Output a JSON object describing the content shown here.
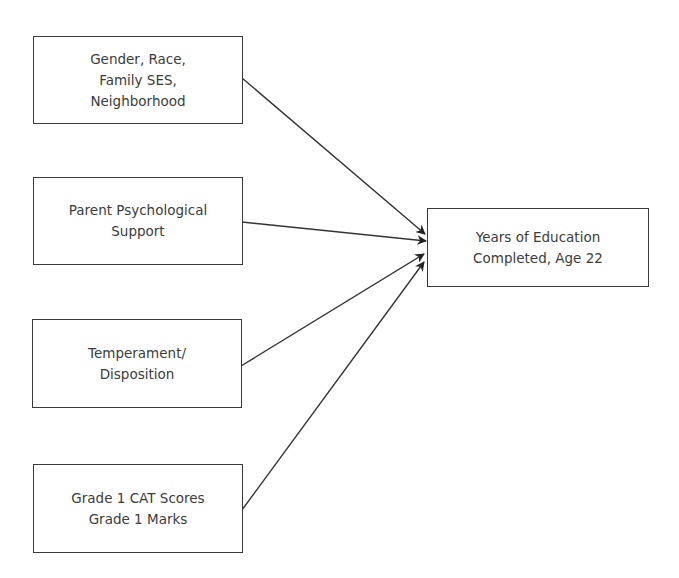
{
  "diagram": {
    "type": "path-diagram",
    "nodes": [
      {
        "id": "n1",
        "label": "Gender, Race,\nFamily SES,\nNeighborhood"
      },
      {
        "id": "n2",
        "label": "Parent Psychological\nSupport"
      },
      {
        "id": "n3",
        "label": "Temperament/\nDisposition"
      },
      {
        "id": "n4",
        "label": "Grade 1 CAT Scores\nGrade 1 Marks"
      },
      {
        "id": "outcome",
        "label": "Years of Education\nCompleted, Age 22"
      }
    ],
    "edges": [
      {
        "from": "n1",
        "to": "outcome"
      },
      {
        "from": "n2",
        "to": "outcome"
      },
      {
        "from": "n3",
        "to": "outcome"
      },
      {
        "from": "n4",
        "to": "outcome"
      }
    ],
    "colors": {
      "line": "#333333",
      "text": "#3b3b3b",
      "background": "#ffffff"
    }
  }
}
